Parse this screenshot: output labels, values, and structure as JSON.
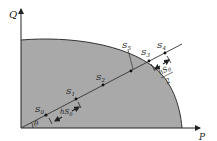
{
  "diagram": {
    "axes": {
      "y_label": "Q",
      "x_label": "P"
    },
    "angle_label": "θ",
    "points": [
      {
        "id": "S0",
        "base": "S",
        "sub": "0"
      },
      {
        "id": "S1",
        "base": "S",
        "sub": "1"
      },
      {
        "id": "S2",
        "base": "S",
        "sub": "2"
      },
      {
        "id": "S3",
        "base": "S",
        "sub": "3"
      },
      {
        "id": "S4",
        "base": "S",
        "sub": "4"
      },
      {
        "id": "S5",
        "base": "S",
        "sub": "5"
      }
    ],
    "step_labels": {
      "initial": {
        "prefix": "h",
        "base": "S",
        "sub": "0"
      },
      "half": {
        "prefix": "h",
        "base": "S",
        "sub": "0",
        "denominator": "2"
      }
    },
    "colors": {
      "region_fill": "#a9a9a9",
      "line": "#222222",
      "background": "#ffffff"
    }
  }
}
